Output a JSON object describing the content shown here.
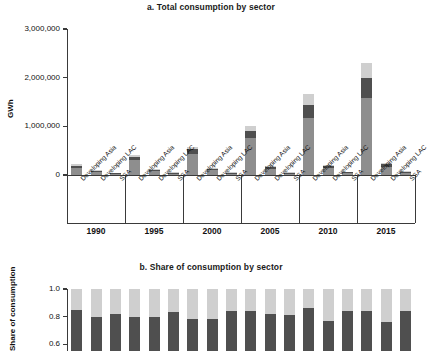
{
  "figure": {
    "panel_a_title": "a. Total consumption by sector",
    "panel_b_title": "b. Share of consumption by sector"
  },
  "chart_data": [
    {
      "id": "panel_a",
      "type": "bar",
      "stacked": true,
      "title": "a. Total consumption by sector",
      "xlabel": "",
      "ylabel": "GWh",
      "ylim": [
        0,
        3000000
      ],
      "ytick_labels": [
        "0",
        "1,000,000",
        "2,000,000",
        "3,000,000"
      ],
      "ytick_values": [
        0,
        1000000,
        2000000,
        3000000
      ],
      "grid": false,
      "legend": "none",
      "group_labels": [
        "1990",
        "1995",
        "2000",
        "2005",
        "2010",
        "2015"
      ],
      "categories": [
        "Developing Asia",
        "Developing LAC",
        "SSA",
        "Developing Asia",
        "Developing LAC",
        "SSA",
        "Developing Asia",
        "Developing LAC",
        "SSA",
        "Developing Asia",
        "Developing LAC",
        "SSA",
        "Developing Asia",
        "Developing LAC",
        "SSA",
        "Developing Asia",
        "Developing LAC",
        "SSA"
      ],
      "series": [
        {
          "name": "sector-bottom",
          "color": "#8e8e8e",
          "values": [
            150000,
            60000,
            18000,
            300000,
            85000,
            22000,
            430000,
            95000,
            26000,
            760000,
            120000,
            30000,
            1170000,
            135000,
            36000,
            1580000,
            160000,
            42000
          ]
        },
        {
          "name": "sector-middle",
          "color": "#4f4f4f",
          "values": [
            45000,
            22000,
            6000,
            70000,
            28000,
            8000,
            95000,
            32000,
            9000,
            145000,
            40000,
            11000,
            270000,
            48000,
            13000,
            420000,
            58000,
            15000
          ]
        },
        {
          "name": "sector-top",
          "color": "#cfcfcf",
          "values": [
            25000,
            12000,
            4000,
            40000,
            15000,
            5000,
            60000,
            18000,
            5500,
            105000,
            22000,
            6500,
            220000,
            28000,
            8000,
            300000,
            34000,
            9500
          ]
        }
      ],
      "totals": [
        220000,
        94000,
        28000,
        410000,
        128000,
        35000,
        585000,
        145000,
        40500,
        1010000,
        182000,
        47500,
        1660000,
        211000,
        57000,
        2300000,
        252000,
        66500
      ]
    },
    {
      "id": "panel_b",
      "type": "bar",
      "stacked": true,
      "normalized": true,
      "title": "b. Share of consumption by sector",
      "xlabel": "",
      "ylabel": "Share of consumption",
      "ylim": [
        0.55,
        1.0
      ],
      "ytick_labels": [
        "0.6",
        "0.8",
        "1.0"
      ],
      "ytick_values": [
        0.6,
        0.8,
        1.0
      ],
      "grid": false,
      "legend": "none",
      "note": "Lower portion of this panel is cropped by the screenshot edge.",
      "categories": [
        "Developing Asia",
        "Developing LAC",
        "SSA",
        "Developing Asia",
        "Developing LAC",
        "SSA",
        "Developing Asia",
        "Developing LAC",
        "SSA",
        "Developing Asia",
        "Developing LAC",
        "SSA",
        "Developing Asia",
        "Developing LAC",
        "SSA",
        "Developing Asia",
        "Developing LAC",
        "SSA"
      ],
      "series": [
        {
          "name": "sector-bottom",
          "color": "#8e8e8e",
          "values": [
            0.03,
            0.02,
            0.08,
            0.03,
            0.02,
            0.04,
            0.03,
            0.05,
            0.09,
            0.03,
            0.03,
            0.05,
            0.03,
            0.06,
            0.04,
            0.03,
            0.05,
            0.04
          ]
        },
        {
          "name": "sector-middle",
          "color": "#4f4f4f",
          "values": [
            0.82,
            0.78,
            0.74,
            0.77,
            0.78,
            0.79,
            0.75,
            0.73,
            0.75,
            0.81,
            0.79,
            0.76,
            0.83,
            0.71,
            0.8,
            0.81,
            0.71,
            0.8
          ]
        },
        {
          "name": "sector-top",
          "color": "#cfcfcf",
          "values": [
            0.15,
            0.2,
            0.18,
            0.2,
            0.2,
            0.17,
            0.22,
            0.22,
            0.16,
            0.16,
            0.18,
            0.19,
            0.14,
            0.23,
            0.16,
            0.16,
            0.24,
            0.16
          ]
        }
      ],
      "tops": [
        0.85,
        0.8,
        0.82,
        0.8,
        0.8,
        0.83,
        0.78,
        0.78,
        0.84,
        0.84,
        0.82,
        0.81,
        0.86,
        0.77,
        0.84,
        0.84,
        0.76,
        0.84
      ],
      "bottoms": [
        0.03,
        0.02,
        0.08,
        0.03,
        0.02,
        0.04,
        0.03,
        0.05,
        0.09,
        0.03,
        0.03,
        0.05,
        0.03,
        0.06,
        0.04,
        0.03,
        0.05,
        0.04
      ]
    }
  ]
}
